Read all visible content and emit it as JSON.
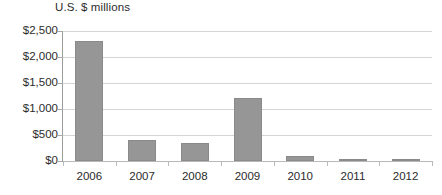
{
  "chart_data": {
    "type": "bar",
    "title": "U.S. $ millions",
    "xlabel": "",
    "ylabel": "",
    "categories": [
      "2006",
      "2007",
      "2008",
      "2009",
      "2010",
      "2011",
      "2012"
    ],
    "values": [
      2300,
      400,
      340,
      1220,
      90,
      25,
      20
    ],
    "series": [
      {
        "name": "U.S. $ millions",
        "values": [
          2300,
          400,
          340,
          1220,
          90,
          25,
          20
        ]
      }
    ],
    "ylim": [
      0,
      2500
    ],
    "ytick_values": [
      0,
      500,
      1000,
      1500,
      2000,
      2500
    ],
    "ytick_labels": [
      "$0",
      "$500",
      "$1,000",
      "$1,500",
      "$2,000",
      "$2,500"
    ],
    "grid": true,
    "legend": false,
    "legend_position": "none",
    "colors": {
      "bar_fill": "#969696",
      "bar_border": "#8a8a8a",
      "gridline": "#d4d4d4",
      "axis": "#9c9c9c",
      "text": "#2b2b2b",
      "background": "#ffffff"
    }
  }
}
